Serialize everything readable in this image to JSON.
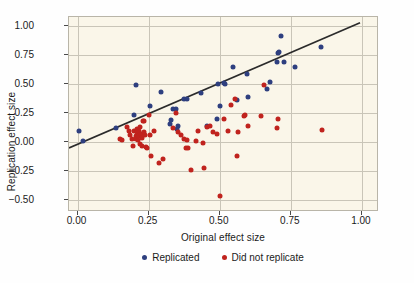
{
  "chart_data": {
    "type": "scatter",
    "title": "",
    "xlabel": "Original effect size",
    "ylabel": "Replication effect size",
    "xlim": [
      -0.03,
      1.06
    ],
    "ylim": [
      -0.6,
      1.08
    ],
    "xticks": [
      "0.00",
      "0.25",
      "0.50",
      "0.75",
      "1.00"
    ],
    "xtick_values": [
      0.0,
      0.25,
      0.5,
      0.75,
      1.0
    ],
    "yticks": [
      "1.00",
      "0.75",
      "0.50",
      "0.25",
      "0.00",
      "−0.25",
      "−0.50"
    ],
    "ytick_values": [
      1.0,
      0.75,
      0.5,
      0.25,
      0.0,
      -0.25,
      -0.5
    ],
    "grid": true,
    "legend_position": "below",
    "plot_background": "#faf6e9",
    "colors": {
      "replicated": "#2e3f7f",
      "failed": "#c0231e",
      "trend_line": "#2b2b2b",
      "grid": "#c9c5b8",
      "frame": "#b9b5a8"
    },
    "trend_line": {
      "label": "reference trend",
      "x1": -0.03,
      "y1": -0.055,
      "x2": 1.0,
      "y2": 1.03
    },
    "series": [
      {
        "name": "Replicated",
        "color": "#2e3f7f",
        "points": [
          [
            0.005,
            0.1
          ],
          [
            0.02,
            0.015
          ],
          [
            0.135,
            0.12
          ],
          [
            0.2,
            0.24
          ],
          [
            0.205,
            0.49
          ],
          [
            0.255,
            0.315
          ],
          [
            0.295,
            0.435
          ],
          [
            0.325,
            0.155
          ],
          [
            0.33,
            0.195
          ],
          [
            0.335,
            0.285
          ],
          [
            0.345,
            0.29
          ],
          [
            0.35,
            0.115
          ],
          [
            0.355,
            0.145
          ],
          [
            0.375,
            0.375
          ],
          [
            0.385,
            0.375
          ],
          [
            0.435,
            0.425
          ],
          [
            0.455,
            0.145
          ],
          [
            0.49,
            0.205
          ],
          [
            0.495,
            0.5
          ],
          [
            0.5,
            0.315
          ],
          [
            0.515,
            0.51
          ],
          [
            0.52,
            0.505
          ],
          [
            0.545,
            0.645
          ],
          [
            0.56,
            0.365
          ],
          [
            0.595,
            0.59
          ],
          [
            0.6,
            0.395
          ],
          [
            0.665,
            0.46
          ],
          [
            0.675,
            0.52
          ],
          [
            0.7,
            0.695
          ],
          [
            0.705,
            0.77
          ],
          [
            0.71,
            0.775
          ],
          [
            0.715,
            0.915
          ],
          [
            0.725,
            0.695
          ],
          [
            0.765,
            0.645
          ],
          [
            0.855,
            0.825
          ]
        ]
      },
      {
        "name": "Did not replicate",
        "color": "#c0231e",
        "points": [
          [
            0.15,
            0.025
          ],
          [
            0.155,
            0.02
          ],
          [
            0.175,
            0.135
          ],
          [
            0.18,
            0.095
          ],
          [
            0.185,
            0.065
          ],
          [
            0.19,
            0.03
          ],
          [
            0.195,
            -0.035
          ],
          [
            0.2,
            0.095
          ],
          [
            0.205,
            0.055
          ],
          [
            0.205,
            0.025
          ],
          [
            0.21,
            0.115
          ],
          [
            0.21,
            0.085
          ],
          [
            0.212,
            0.02
          ],
          [
            0.215,
            0.1
          ],
          [
            0.215,
            0.055
          ],
          [
            0.218,
            -0.01
          ],
          [
            0.22,
            0.13
          ],
          [
            0.222,
            0.075
          ],
          [
            0.225,
            0.035
          ],
          [
            0.228,
            -0.035
          ],
          [
            0.23,
            0.185
          ],
          [
            0.232,
            0.185
          ],
          [
            0.235,
            0.09
          ],
          [
            0.238,
            0.06
          ],
          [
            0.24,
            -0.04
          ],
          [
            0.245,
            -0.045
          ],
          [
            0.25,
            0.24
          ],
          [
            0.255,
            0.065
          ],
          [
            0.26,
            -0.115
          ],
          [
            0.27,
            0.095
          ],
          [
            0.285,
            -0.175
          ],
          [
            0.3,
            -0.14
          ],
          [
            0.335,
            0.12
          ],
          [
            0.345,
            0.255
          ],
          [
            0.355,
            0.085
          ],
          [
            0.365,
            0.065
          ],
          [
            0.375,
            0.025
          ],
          [
            0.38,
            -0.045
          ],
          [
            0.385,
            0.02
          ],
          [
            0.39,
            -0.05
          ],
          [
            0.4,
            -0.235
          ],
          [
            0.415,
            0.01
          ],
          [
            0.425,
            0.095
          ],
          [
            0.44,
            -0.005
          ],
          [
            0.445,
            -0.225
          ],
          [
            0.455,
            0.135
          ],
          [
            0.465,
            0.145
          ],
          [
            0.475,
            0.085
          ],
          [
            0.49,
            0.075
          ],
          [
            0.5,
            -0.46
          ],
          [
            0.515,
            0.205
          ],
          [
            0.53,
            0.1
          ],
          [
            0.54,
            0.325
          ],
          [
            0.555,
            0.375
          ],
          [
            0.56,
            -0.12
          ],
          [
            0.565,
            0.085
          ],
          [
            0.585,
            0.225
          ],
          [
            0.59,
            0.235
          ],
          [
            0.6,
            0.145
          ],
          [
            0.645,
            0.225
          ],
          [
            0.655,
            0.495
          ],
          [
            0.7,
            0.125
          ],
          [
            0.705,
            0.205
          ],
          [
            0.86,
            0.11
          ]
        ]
      }
    ]
  },
  "legend": {
    "entries": [
      {
        "label": "Replicated"
      },
      {
        "label": "Did not replicate"
      }
    ]
  }
}
